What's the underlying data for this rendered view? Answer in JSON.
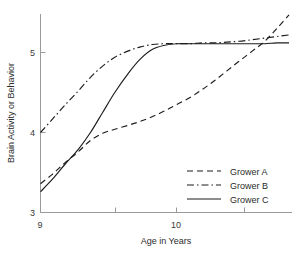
{
  "chart_data": {
    "type": "line",
    "title": "",
    "xlabel": "Age in Years",
    "ylabel": "Brain Activity or Behavior",
    "xlim": [
      9,
      10.84
    ],
    "ylim": [
      3,
      5.47
    ],
    "grid": false,
    "legend_position": "lower-right",
    "x_ticks": [
      {
        "value": 9,
        "label": "9",
        "major": true
      },
      {
        "value": 9.55,
        "label": "",
        "major": false
      },
      {
        "value": 10,
        "label": "10",
        "major": true
      },
      {
        "value": 10.5,
        "label": "",
        "major": false
      }
    ],
    "y_ticks": [
      {
        "value": 3,
        "label": "3"
      },
      {
        "value": 4,
        "label": "4"
      },
      {
        "value": 5,
        "label": "5"
      }
    ],
    "series": [
      {
        "name": "Grower A",
        "style": "dashed",
        "dasharray": "6,4",
        "x": [
          9.0,
          9.09,
          9.18,
          9.28,
          9.37,
          9.46,
          9.55,
          9.65,
          9.74,
          9.83,
          9.92,
          10.01,
          10.11,
          10.2,
          10.29,
          10.38,
          10.47,
          10.57,
          10.66,
          10.75,
          10.84
        ],
        "y": [
          3.36,
          3.48,
          3.62,
          3.76,
          3.9,
          3.99,
          4.04,
          4.09,
          4.14,
          4.2,
          4.27,
          4.35,
          4.44,
          4.54,
          4.65,
          4.77,
          4.89,
          5.02,
          5.14,
          5.3,
          5.47
        ]
      },
      {
        "name": "Grower B",
        "style": "dash-dot",
        "dasharray": "7,3,1.5,3",
        "x": [
          9.0,
          9.09,
          9.18,
          9.28,
          9.37,
          9.46,
          9.55,
          9.65,
          9.74,
          9.83,
          9.92,
          10.01,
          10.11,
          10.2,
          10.29,
          10.38,
          10.47,
          10.57,
          10.66,
          10.75,
          10.84
        ],
        "y": [
          4.0,
          4.17,
          4.34,
          4.52,
          4.69,
          4.83,
          4.94,
          5.02,
          5.07,
          5.1,
          5.11,
          5.11,
          5.11,
          5.12,
          5.12,
          5.13,
          5.14,
          5.16,
          5.18,
          5.2,
          5.22
        ]
      },
      {
        "name": "Grower C",
        "style": "solid",
        "dasharray": "",
        "x": [
          9.0,
          9.09,
          9.18,
          9.28,
          9.37,
          9.46,
          9.55,
          9.65,
          9.74,
          9.83,
          9.92,
          10.01,
          10.11,
          10.2,
          10.29,
          10.38,
          10.47,
          10.57,
          10.66,
          10.75,
          10.84
        ],
        "y": [
          3.26,
          3.42,
          3.6,
          3.79,
          4.0,
          4.25,
          4.5,
          4.74,
          4.92,
          5.04,
          5.09,
          5.11,
          5.11,
          5.11,
          5.11,
          5.11,
          5.11,
          5.11,
          5.11,
          5.12,
          5.12
        ]
      }
    ]
  },
  "legend": {
    "items": [
      {
        "label": "Grower A"
      },
      {
        "label": "Grower B"
      },
      {
        "label": "Grower C"
      }
    ]
  },
  "colors": {
    "curve": "#1c1c1c",
    "axis": "#9a9a9a",
    "text": "#2b2b2b",
    "background": "#ffffff"
  }
}
